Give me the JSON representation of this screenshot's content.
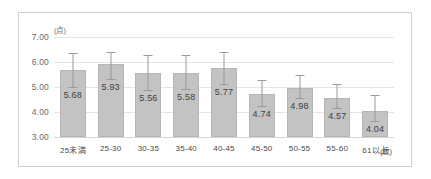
{
  "chart_data": {
    "type": "bar",
    "title": "",
    "xlabel": "(歳)",
    "ylabel": "(点)",
    "ylim": [
      3.0,
      7.0
    ],
    "ytick_labels": [
      "7.00",
      "6.00",
      "5.00",
      "4.00",
      "3.00"
    ],
    "ytick_values": [
      7.0,
      6.0,
      5.0,
      4.0,
      3.0
    ],
    "grid": true,
    "legend": "none",
    "categories": [
      "25未満",
      "25-30",
      "30-35",
      "35-40",
      "40-45",
      "45-50",
      "50-55",
      "55-60",
      "61以上"
    ],
    "values": [
      5.68,
      5.93,
      5.56,
      5.58,
      5.77,
      4.74,
      4.98,
      4.57,
      4.04
    ],
    "value_labels": [
      "5.68",
      "5.93",
      "5.56",
      "5.58",
      "5.77",
      "4.74",
      "4.98",
      "4.57",
      "4.04"
    ],
    "error_upper": [
      0.67,
      0.47,
      0.73,
      0.71,
      0.63,
      0.54,
      0.52,
      0.56,
      0.63
    ],
    "error_lower": [
      0.67,
      0.6,
      0.66,
      0.67,
      0.65,
      0.5,
      0.41,
      0.4,
      0.4
    ],
    "bar_color": "#c3c3c3",
    "bar_border_color": "#b6b6b6",
    "error_bar_color": "#9a9a9a",
    "gridline_color": "#e4e4e4",
    "frame_color": "#d0d0d0",
    "background_color": "#ffffff"
  }
}
